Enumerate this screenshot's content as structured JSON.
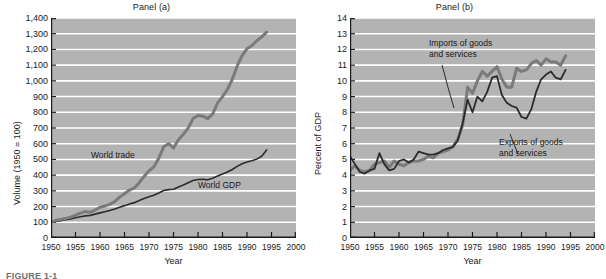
{
  "figure": {
    "caption": "FIGURE 1-1",
    "background": "#ffffff",
    "plot_background": "#b3b3b3",
    "gridline_color": "#ffffff"
  },
  "panels": [
    {
      "name": "panel-a",
      "title": "Panel (a)",
      "xlabel": "Year",
      "ylabel": "Volume (1950 = 100)",
      "yticks": [
        "0",
        "100",
        "200",
        "300",
        "400",
        "500",
        "600",
        "700",
        "800",
        "900",
        "1,000",
        "1,100",
        "1,200",
        "1,300",
        "1,400"
      ],
      "xticks": [
        "1950",
        "1955",
        "1960",
        "1965",
        "1970",
        "1975",
        "1980",
        "1985",
        "1990",
        "1995",
        "2000"
      ],
      "annotations": [
        {
          "name": "world-trade-label",
          "text": "World trade"
        },
        {
          "name": "world-gdp-label",
          "text": "World GDP"
        }
      ]
    },
    {
      "name": "panel-b",
      "title": "Panel (b)",
      "xlabel": "Year",
      "ylabel": "Percent of GDP",
      "yticks": [
        "0",
        "1",
        "2",
        "3",
        "4",
        "5",
        "6",
        "7",
        "8",
        "9",
        "10",
        "11",
        "12",
        "13",
        "14"
      ],
      "xticks": [
        "1950",
        "1955",
        "1960",
        "1965",
        "1970",
        "1975",
        "1980",
        "1985",
        "1990",
        "1995",
        "2000"
      ],
      "annotations": [
        {
          "name": "imports-label-line1",
          "text": "Imports of goods"
        },
        {
          "name": "imports-label-line2",
          "text": "and services"
        },
        {
          "name": "exports-label-line1",
          "text": "Exports of goods"
        },
        {
          "name": "exports-label-line2",
          "text": "and services"
        }
      ]
    }
  ],
  "chart_data": [
    {
      "type": "line",
      "title": "Panel (a)",
      "xlabel": "Year",
      "ylabel": "Volume (1950 = 100)",
      "xlim": [
        1950,
        2000
      ],
      "ylim": [
        0,
        1400
      ],
      "ytick_step": 100,
      "xtick_step": 5,
      "grid": "horizontal",
      "legend": "inline-annotation",
      "series": [
        {
          "name": "World trade",
          "color": "#7a7a7a",
          "width": 3,
          "x": [
            1950,
            1951,
            1952,
            1953,
            1954,
            1955,
            1956,
            1957,
            1958,
            1959,
            1960,
            1961,
            1962,
            1963,
            1964,
            1965,
            1966,
            1967,
            1968,
            1969,
            1970,
            1971,
            1972,
            1973,
            1974,
            1975,
            1976,
            1977,
            1978,
            1979,
            1980,
            1981,
            1982,
            1983,
            1984,
            1985,
            1986,
            1987,
            1988,
            1989,
            1990,
            1991,
            1992,
            1993,
            1994
          ],
          "y": [
            100,
            112,
            118,
            124,
            133,
            145,
            158,
            168,
            163,
            178,
            196,
            204,
            214,
            232,
            260,
            282,
            305,
            318,
            352,
            392,
            428,
            453,
            508,
            580,
            600,
            572,
            625,
            660,
            700,
            760,
            780,
            775,
            760,
            790,
            860,
            900,
            945,
            1010,
            1095,
            1160,
            1205,
            1225,
            1255,
            1280,
            1310
          ]
        },
        {
          "name": "World GDP",
          "color": "#2b2b2b",
          "width": 1.6,
          "x": [
            1950,
            1951,
            1952,
            1953,
            1954,
            1955,
            1956,
            1957,
            1958,
            1959,
            1960,
            1961,
            1962,
            1963,
            1964,
            1965,
            1966,
            1967,
            1968,
            1969,
            1970,
            1971,
            1972,
            1973,
            1974,
            1975,
            1976,
            1977,
            1978,
            1979,
            1980,
            1981,
            1982,
            1983,
            1984,
            1985,
            1986,
            1987,
            1988,
            1989,
            1990,
            1991,
            1992,
            1993,
            1994
          ],
          "y": [
            100,
            106,
            110,
            116,
            121,
            129,
            135,
            141,
            144,
            152,
            160,
            167,
            175,
            184,
            196,
            206,
            217,
            225,
            238,
            252,
            262,
            272,
            286,
            302,
            308,
            310,
            325,
            337,
            352,
            366,
            372,
            374,
            370,
            380,
            395,
            408,
            420,
            436,
            456,
            472,
            484,
            492,
            502,
            520,
            560
          ]
        }
      ]
    },
    {
      "type": "line",
      "title": "Panel (b)",
      "xlabel": "Year",
      "ylabel": "Percent of GDP",
      "xlim": [
        1950,
        2000
      ],
      "ylim": [
        0,
        14
      ],
      "ytick_step": 1,
      "xtick_step": 5,
      "grid": "horizontal",
      "legend": "inline-annotation",
      "series": [
        {
          "name": "Imports of goods and services",
          "color": "#7a7a7a",
          "width": 3,
          "x": [
            1950,
            1951,
            1952,
            1953,
            1954,
            1955,
            1956,
            1957,
            1958,
            1959,
            1960,
            1961,
            1962,
            1963,
            1964,
            1965,
            1966,
            1967,
            1968,
            1969,
            1970,
            1971,
            1972,
            1973,
            1974,
            1975,
            1976,
            1977,
            1978,
            1979,
            1980,
            1981,
            1982,
            1983,
            1984,
            1985,
            1986,
            1987,
            1988,
            1989,
            1990,
            1991,
            1992,
            1993,
            1994
          ],
          "y": [
            4.3,
            4.6,
            4.3,
            4.2,
            4.3,
            4.7,
            4.8,
            4.9,
            4.5,
            4.9,
            4.7,
            4.6,
            4.8,
            4.9,
            4.9,
            5.0,
            5.2,
            5.1,
            5.4,
            5.5,
            5.6,
            5.8,
            6.3,
            7.2,
            9.6,
            9.2,
            10.0,
            10.6,
            10.3,
            10.6,
            10.9,
            10.1,
            9.6,
            9.6,
            10.8,
            10.6,
            10.7,
            11.1,
            11.3,
            11.0,
            11.4,
            11.2,
            11.2,
            11.0,
            11.6,
            11.3,
            11.7,
            12.7
          ]
        },
        {
          "name": "Exports of goods and services",
          "color": "#2b2b2b",
          "width": 1.8,
          "x": [
            1950,
            1951,
            1952,
            1953,
            1954,
            1955,
            1956,
            1957,
            1958,
            1959,
            1960,
            1961,
            1962,
            1963,
            1964,
            1965,
            1966,
            1967,
            1968,
            1969,
            1970,
            1971,
            1972,
            1973,
            1974,
            1975,
            1976,
            1977,
            1978,
            1979,
            1980,
            1981,
            1982,
            1983,
            1984,
            1985,
            1986,
            1987,
            1988,
            1989,
            1990,
            1991,
            1992,
            1993,
            1994
          ],
          "y": [
            5.2,
            4.7,
            4.2,
            4.1,
            4.3,
            4.4,
            5.4,
            4.7,
            4.3,
            4.4,
            4.9,
            5.0,
            4.8,
            5.0,
            5.5,
            5.4,
            5.3,
            5.3,
            5.4,
            5.6,
            5.7,
            5.8,
            6.2,
            7.3,
            8.8,
            8.0,
            9.0,
            8.7,
            9.3,
            10.2,
            10.3,
            9.1,
            8.6,
            8.4,
            8.3,
            7.7,
            7.6,
            8.2,
            9.3,
            10.1,
            10.4,
            10.6,
            10.2,
            10.1,
            10.7,
            11.2
          ]
        }
      ]
    }
  ]
}
